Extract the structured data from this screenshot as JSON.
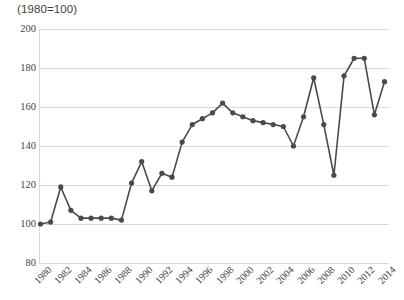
{
  "chart_data": {
    "type": "line",
    "title": "(1980=100)",
    "xlabel": "",
    "ylabel": "",
    "ylim": [
      80,
      200
    ],
    "ytick_labels": [
      "200",
      "180",
      "160",
      "140",
      "120",
      "100",
      "80"
    ],
    "ytick_values": [
      200,
      180,
      160,
      140,
      120,
      100,
      80
    ],
    "grid": true,
    "legend": "none",
    "x_tick_labels": [
      "1980",
      "1982",
      "1984",
      "1986",
      "1988",
      "1990",
      "1992",
      "1994",
      "1996",
      "1998",
      "2000",
      "2002",
      "2004",
      "2006",
      "2008",
      "2010",
      "2012",
      "2014"
    ],
    "x": [
      1980,
      1981,
      1982,
      1983,
      1984,
      1985,
      1986,
      1987,
      1988,
      1989,
      1990,
      1991,
      1992,
      1993,
      1994,
      1995,
      1996,
      1997,
      1998,
      1999,
      2000,
      2001,
      2002,
      2003,
      2004,
      2005,
      2006,
      2007,
      2008,
      2009,
      2010,
      2011,
      2012,
      2013,
      2014
    ],
    "values": [
      100,
      101,
      119,
      107,
      103,
      103,
      103,
      103,
      102,
      121,
      132,
      117,
      126,
      124,
      142,
      151,
      154,
      157,
      162,
      157,
      155,
      153,
      152,
      151,
      150,
      140,
      155,
      175,
      151,
      125,
      176,
      185,
      185,
      156,
      173
    ],
    "series": [
      {
        "name": "index",
        "values": [
          100,
          101,
          119,
          107,
          103,
          103,
          103,
          103,
          102,
          121,
          132,
          117,
          126,
          124,
          142,
          151,
          154,
          157,
          162,
          157,
          155,
          153,
          152,
          151,
          150,
          140,
          155,
          175,
          151,
          125,
          176,
          185,
          185,
          156,
          173
        ]
      }
    ],
    "colors": {
      "line": "#4a4a4a",
      "marker": "#4a4a4a",
      "grid": "#d9d9d9",
      "text": "#3f3f3f",
      "background": "#ffffff"
    }
  }
}
